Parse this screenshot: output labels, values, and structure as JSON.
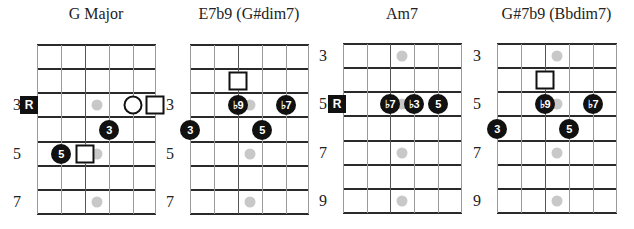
{
  "diagrams": [
    {
      "title": "G Major",
      "left": 37,
      "right": 155,
      "top": 45,
      "bottom": 214,
      "string_x": [
        37,
        61,
        85,
        109,
        133,
        155
      ],
      "fret_y": [
        45,
        69,
        93,
        117,
        142,
        166,
        190,
        214
      ],
      "fret_numbers": [
        {
          "label": "3",
          "row": 2
        },
        {
          "label": "5",
          "row": 4
        },
        {
          "label": "7",
          "row": 6
        }
      ],
      "inlays": [
        {
          "row": 2
        },
        {
          "row": 4
        },
        {
          "row": 6
        }
      ],
      "markers": [
        {
          "type": "root",
          "label": "R",
          "string": 0,
          "row": 2,
          "dx": -8
        },
        {
          "type": "ring",
          "label": "",
          "string": 4,
          "row": 2
        },
        {
          "type": "square",
          "label": "",
          "string": 5,
          "row": 2
        },
        {
          "type": "note",
          "label": "3",
          "string": 3,
          "row": 3
        },
        {
          "type": "note",
          "label": "5",
          "string": 1,
          "row": 4
        },
        {
          "type": "square",
          "label": "",
          "string": 2,
          "row": 4
        }
      ]
    },
    {
      "title": "E7b9 (G#dim7)",
      "left": 190,
      "right": 308,
      "top": 45,
      "bottom": 214,
      "string_x": [
        190,
        214,
        238,
        262,
        286,
        308
      ],
      "fret_y": [
        45,
        69,
        93,
        117,
        142,
        166,
        190,
        214
      ],
      "fret_numbers": [
        {
          "label": "3",
          "row": 2
        },
        {
          "label": "5",
          "row": 4
        },
        {
          "label": "7",
          "row": 6
        }
      ],
      "inlays": [
        {
          "row": 2
        },
        {
          "row": 4
        },
        {
          "row": 6
        }
      ],
      "markers": [
        {
          "type": "square",
          "label": "",
          "string": 2,
          "row": 1
        },
        {
          "type": "note",
          "label": "♭9",
          "string": 2,
          "row": 2
        },
        {
          "type": "note",
          "label": "♭7",
          "string": 4,
          "row": 2
        },
        {
          "type": "note",
          "label": "3",
          "string": 0,
          "row": 3
        },
        {
          "type": "note",
          "label": "5",
          "string": 3,
          "row": 3
        }
      ]
    },
    {
      "title": "Am7",
      "left": 343,
      "right": 461,
      "top": 44,
      "bottom": 213,
      "string_x": [
        343,
        367,
        390,
        414,
        438,
        461
      ],
      "fret_y": [
        44,
        68,
        92,
        116,
        141,
        165,
        189,
        213
      ],
      "fret_numbers": [
        {
          "label": "3",
          "row": 0
        },
        {
          "label": "5",
          "row": 2
        },
        {
          "label": "7",
          "row": 4
        },
        {
          "label": "9",
          "row": 6
        }
      ],
      "inlays": [
        {
          "row": 0
        },
        {
          "row": 2
        },
        {
          "row": 4
        },
        {
          "row": 6
        }
      ],
      "markers": [
        {
          "type": "root",
          "label": "R",
          "string": 0,
          "row": 2,
          "dx": -6
        },
        {
          "type": "note",
          "label": "♭7",
          "string": 2,
          "row": 2
        },
        {
          "type": "note",
          "label": "♭3",
          "string": 3,
          "row": 2
        },
        {
          "type": "note",
          "label": "5",
          "string": 4,
          "row": 2
        }
      ]
    },
    {
      "title": "G#7b9 (Bbdim7)",
      "left": 497,
      "right": 616,
      "top": 44,
      "bottom": 213,
      "string_x": [
        497,
        521,
        545,
        569,
        593,
        616
      ],
      "fret_y": [
        44,
        68,
        92,
        116,
        141,
        165,
        189,
        213
      ],
      "fret_numbers": [
        {
          "label": "3",
          "row": 0
        },
        {
          "label": "5",
          "row": 2
        },
        {
          "label": "7",
          "row": 4
        },
        {
          "label": "9",
          "row": 6
        }
      ],
      "inlays": [
        {
          "row": 0
        },
        {
          "row": 2
        },
        {
          "row": 4
        },
        {
          "row": 6
        }
      ],
      "markers": [
        {
          "type": "square",
          "label": "",
          "string": 2,
          "row": 1
        },
        {
          "type": "note",
          "label": "♭9",
          "string": 2,
          "row": 2
        },
        {
          "type": "note",
          "label": "♭7",
          "string": 4,
          "row": 2
        },
        {
          "type": "note",
          "label": "3",
          "string": 0,
          "row": 3
        },
        {
          "type": "note",
          "label": "5",
          "string": 3,
          "row": 3
        }
      ]
    }
  ],
  "colors": {
    "marker_fill": "#111111",
    "marker_text": "#ffffff",
    "inlay": "#c8c8c8",
    "fret_line": "#2a2a2a",
    "string_line": "#9a9a9a"
  }
}
